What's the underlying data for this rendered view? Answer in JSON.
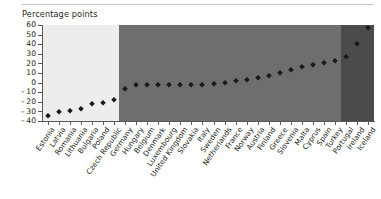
{
  "figure": {
    "axis_title": "Percentage points",
    "top_rule": true
  },
  "colors": {
    "band_light": "#ededeb",
    "band_mid": "#6d6e70",
    "band_dark": "#4b4b4d",
    "marker": "#1a1a1a",
    "axis": "#58585a",
    "text": "#231f20",
    "rule": "#c9c9c9",
    "page_background": "#ffffff"
  },
  "chart_data": {
    "type": "scatter",
    "title": "",
    "subtitle": "",
    "xlabel": "",
    "ylabel": "Percentage points",
    "ylim": [
      -40,
      60
    ],
    "yticks": [
      -40,
      -30,
      -20,
      -10,
      0,
      10,
      20,
      30,
      40,
      50,
      60
    ],
    "ytick_labels": [
      "– 40",
      "– 30",
      "– 20",
      "– 10",
      "0",
      "10",
      "20",
      "30",
      "40",
      "50",
      "60"
    ],
    "grid": false,
    "legend": "none",
    "categories": [
      "Estonia",
      "Latvia",
      "Romania",
      "Lithuania",
      "Bulgaria",
      "Poland",
      "Czech Republic",
      "Germany",
      "Hungary",
      "Belgium",
      "Denmark",
      "Luxembourg",
      "United Kingdom",
      "Slovakia",
      "Italy",
      "Sweden",
      "Netherlands",
      "France",
      "Norway",
      "Austria",
      "Finland",
      "Greece",
      "Slovenia",
      "Malta",
      "Cyprus",
      "Spain",
      "Turkey",
      "Portugal",
      "Ireland",
      "Iceland"
    ],
    "values": [
      -35,
      -31,
      -30,
      -28,
      -22,
      -21,
      -18,
      -7,
      -2,
      -2,
      -2,
      -2,
      -2,
      -2,
      -2,
      -1,
      0,
      2,
      3,
      5,
      7,
      10,
      13,
      16,
      18,
      20,
      22,
      27,
      40,
      57
    ],
    "bands": [
      {
        "name": "band-light",
        "start_index": 0,
        "end_index": 6,
        "color": "#ededeb"
      },
      {
        "name": "band-mid",
        "start_index": 7,
        "end_index": 26,
        "color": "#6d6e70"
      },
      {
        "name": "band-dark",
        "start_index": 27,
        "end_index": 29,
        "color": "#4b4b4d"
      }
    ]
  }
}
